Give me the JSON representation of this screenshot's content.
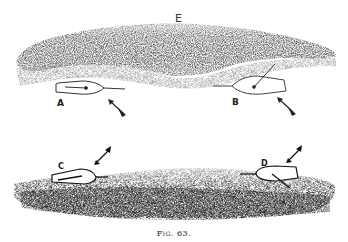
{
  "figure": {
    "caption": "Fig. 63.",
    "top_panel": {
      "region_label": "E",
      "shore_label": "Shore",
      "boats": [
        {
          "label": "A"
        },
        {
          "label": "B"
        }
      ]
    },
    "bottom_panel": {
      "shore_label": "Shore",
      "boats": [
        {
          "label": "C"
        },
        {
          "label": "D"
        }
      ]
    },
    "colors": {
      "ink": "#1a1a1a",
      "paper": "#ffffff",
      "shading_mid": "#666666"
    }
  }
}
